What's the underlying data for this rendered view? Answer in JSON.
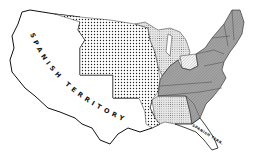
{
  "map": {
    "labels": {
      "west": "SPANISH TERRITORY",
      "florida": "SPANISH TERR."
    },
    "regions": [
      {
        "name": "spanish-territory-west",
        "fill": "white"
      },
      {
        "name": "louisiana-purchase",
        "fill": "coarse-dots"
      },
      {
        "name": "northwest-territory",
        "fill": "fine-dots"
      },
      {
        "name": "ohio",
        "fill": "light-hatch"
      },
      {
        "name": "mississippi-territory",
        "fill": "fine-dots"
      },
      {
        "name": "original-states",
        "fill": "gray-hatch"
      },
      {
        "name": "spanish-florida",
        "fill": "white"
      }
    ],
    "colors": {
      "outline": "#111111",
      "gray_states": "#9a9a9a",
      "background": "#ffffff"
    }
  }
}
